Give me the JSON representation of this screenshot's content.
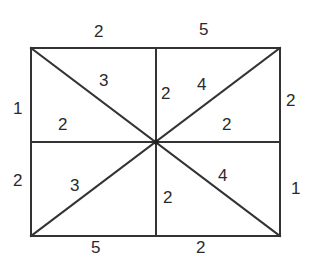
{
  "diagram": {
    "type": "rectangle-subdivided-by-diagonals-and-midlines",
    "colors": {
      "line": "#333333",
      "text": "#2a2a2a",
      "background": "#ffffff"
    },
    "rect": {
      "x1": 31,
      "y1": 48,
      "x2": 280,
      "y2": 236
    },
    "center": {
      "x": 156,
      "y": 142
    },
    "outer_labels": {
      "top_left": "2",
      "top_right": "5",
      "left_top": "1",
      "left_bottom": "2",
      "right_top": "2",
      "right_bottom": "1",
      "bottom_left": "5",
      "bottom_right": "2"
    },
    "inner_labels": {
      "ul_diag": "3",
      "ul_lower": "2",
      "ur_vert": "2",
      "ur_diag": "4",
      "ur_lower": "2",
      "ll_diag": "3",
      "lr_vert": "2",
      "lr_diag": "4"
    }
  }
}
